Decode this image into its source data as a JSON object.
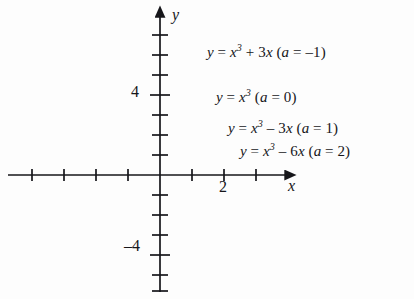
{
  "figure": {
    "background_color": "#fdfdfd",
    "ink_color": "#16161a"
  },
  "axes": {
    "x_name": "x",
    "y_name": "y",
    "origin_px": [
      160,
      175
    ],
    "x_units_per_px": 32,
    "y_units_per_px": 20,
    "x_range": [
      -4.4,
      4.0
    ],
    "y_range": [
      -6.2,
      8.2
    ],
    "tick_labels_x": [
      {
        "value": 2,
        "text": "2"
      }
    ],
    "tick_labels_y": [
      {
        "value": 4,
        "text": "4"
      },
      {
        "value": -4,
        "text": "–4"
      }
    ],
    "x_tick_values": [
      -4,
      -3,
      -2,
      -1,
      1,
      2,
      3
    ],
    "y_tick_values": [
      -6,
      -5,
      -4,
      -3,
      -2,
      -1,
      1,
      2,
      3,
      4,
      5,
      6,
      7
    ],
    "grid": false,
    "arrowheads": [
      "x-positive",
      "y-positive"
    ]
  },
  "labels": {
    "a_neg1": {
      "lhs": "y",
      "eq": " = ",
      "base": "x",
      "power": "3",
      "term": " + 3",
      "var": "x",
      "paren": "(",
      "a_sym": "a",
      "a_eq": " = –1)"
    },
    "a_0": {
      "lhs": "y",
      "eq": " = ",
      "base": "x",
      "power": "3",
      "term": "",
      "var": "",
      "paren": "(",
      "a_sym": "a",
      "a_eq": " = 0)"
    },
    "a_1": {
      "lhs": "y",
      "eq": " = ",
      "base": "x",
      "power": "3",
      "term": " – 3",
      "var": "x",
      "paren": "(",
      "a_sym": "a",
      "a_eq": " = 1)"
    },
    "a_2": {
      "lhs": "y",
      "eq": " = ",
      "base": "x",
      "power": "3",
      "term": " – 6",
      "var": "x",
      "paren": "(",
      "a_sym": "a",
      "a_eq": " = 2)"
    }
  },
  "chart_data": {
    "type": "line",
    "title": "",
    "xlabel": "x",
    "ylabel": "y",
    "xlim": [
      -4.4,
      4.0
    ],
    "ylim": [
      -6.2,
      8.2
    ],
    "grid": false,
    "legend_position": "inline-right",
    "family": "y = x^3 + a*x",
    "series": [
      {
        "name": "y = x³ + 3x  (a = –1)",
        "a": -1,
        "equation": "y = x^3 + 3x",
        "x": [
          -1.75,
          -1.5,
          -1.25,
          -1.0,
          -0.75,
          -0.5,
          -0.25,
          0,
          0.25,
          0.5,
          0.75,
          1.0,
          1.25,
          1.5
        ],
        "y": [
          -10.6,
          -7.875,
          -5.7,
          -4.0,
          -2.67,
          -1.625,
          -0.766,
          0,
          0.766,
          1.625,
          2.67,
          4.0,
          5.7,
          7.875
        ],
        "monotonic": true,
        "local_extrema": []
      },
      {
        "name": "y = x³  (a = 0)",
        "a": 0,
        "equation": "y = x^3",
        "x": [
          -2.0,
          -1.75,
          -1.5,
          -1.25,
          -1.0,
          -0.75,
          -0.5,
          -0.25,
          0,
          0.25,
          0.5,
          0.75,
          1.0,
          1.25,
          1.5,
          1.75,
          2.0
        ],
        "y": [
          -8.0,
          -5.36,
          -3.375,
          -1.95,
          -1.0,
          -0.42,
          -0.125,
          -0.016,
          0,
          0.016,
          0.125,
          0.42,
          1.0,
          1.95,
          3.375,
          5.36,
          8.0
        ],
        "monotonic": true,
        "local_extrema": [
          {
            "type": "inflection",
            "x": 0,
            "y": 0
          }
        ]
      },
      {
        "name": "y = x³ – 3x  (a = 1)",
        "a": 1,
        "equation": "y = x^3 - 3x",
        "x": [
          -2.6,
          -2.25,
          -2.0,
          -1.75,
          -1.5,
          -1.0,
          -0.5,
          0,
          0.5,
          1.0,
          1.5,
          1.75,
          2.0,
          2.25,
          2.45
        ],
        "y": [
          -9.78,
          -4.64,
          -2.0,
          -0.11,
          1.125,
          2.0,
          1.375,
          0,
          -1.375,
          -2.0,
          -1.125,
          0.11,
          2.0,
          4.64,
          7.36
        ],
        "local_extrema": [
          {
            "type": "max",
            "x": -1.0,
            "y": 2.0
          },
          {
            "type": "min",
            "x": 1.0,
            "y": -2.0
          }
        ],
        "roots": [
          -1.732,
          0,
          1.732
        ]
      },
      {
        "name": "y = x³ – 6x  (a = 2)",
        "a": 2,
        "equation": "y = x^3 - 6x",
        "x": [
          -3.1,
          -2.75,
          -2.45,
          -2.0,
          -1.6,
          -1.4,
          -1.0,
          -0.5,
          0,
          0.5,
          1.0,
          1.4,
          1.6,
          2.0,
          2.45,
          2.75,
          3.0
        ],
        "y": [
          -10.2,
          -4.3,
          -0.0,
          4.0,
          5.5,
          5.66,
          5.0,
          2.875,
          0,
          -2.875,
          -5.0,
          -5.66,
          -5.5,
          -4.0,
          0.0,
          4.3,
          9.0
        ],
        "local_extrema": [
          {
            "type": "max",
            "x": -1.414,
            "y": 5.66
          },
          {
            "type": "min",
            "x": 1.414,
            "y": -5.66
          }
        ],
        "roots": [
          -2.449,
          0,
          2.449
        ]
      }
    ]
  }
}
